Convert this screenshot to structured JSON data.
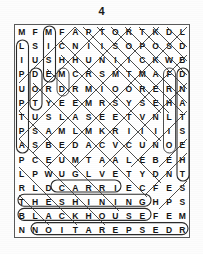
{
  "puzzle": {
    "number": "4",
    "type": "word-search",
    "rows": 15,
    "cols": 13,
    "grid": [
      [
        "M",
        "F",
        "M",
        "F",
        "A",
        "P",
        "T",
        "O",
        "R",
        "T",
        "K",
        "D",
        "L"
      ],
      [
        "L",
        "S",
        "I",
        "C",
        "N",
        "I",
        "I",
        "S",
        "O",
        "P",
        "O",
        "S",
        "D"
      ],
      [
        "I",
        "U",
        "S",
        "H",
        "H",
        "U",
        "N",
        "I",
        "I",
        "C",
        "K",
        "W",
        "B"
      ],
      [
        "P",
        "D",
        "E",
        "M",
        "C",
        "R",
        "S",
        "M",
        "T",
        "M",
        "A",
        "F",
        "D"
      ],
      [
        "U",
        "O",
        "R",
        "D",
        "R",
        "M",
        "I",
        "O",
        "O",
        "R",
        "E",
        "R",
        "N"
      ],
      [
        "P",
        "T",
        "Y",
        "E",
        "E",
        "M",
        "R",
        "S",
        "Y",
        "S",
        "E",
        "H",
        "A"
      ],
      [
        "T",
        "U",
        "S",
        "L",
        "A",
        "S",
        "E",
        "E",
        "T",
        "V",
        "N",
        "L",
        "T"
      ],
      [
        "P",
        "S",
        "A",
        "M",
        "L",
        "M",
        "K",
        "R",
        "I",
        "I",
        "I",
        "I",
        "S"
      ],
      [
        "A",
        "S",
        "B",
        "E",
        "D",
        "A",
        "C",
        "V",
        "C",
        "U",
        "N",
        "O",
        "E"
      ],
      [
        "P",
        "C",
        "E",
        "U",
        "M",
        "T",
        "A",
        "A",
        "L",
        "E",
        "B",
        "E",
        "H"
      ],
      [
        "L",
        "P",
        "W",
        "U",
        "G",
        "L",
        "V",
        "E",
        "T",
        "Y",
        "D",
        "N",
        "T"
      ],
      [
        "R",
        "L",
        "D",
        "C",
        "A",
        "R",
        "R",
        "I",
        "E",
        "C",
        "F",
        "E",
        "S"
      ],
      [
        "T",
        "H",
        "E",
        "S",
        "H",
        "I",
        "N",
        "I",
        "N",
        "G",
        "H",
        "P",
        "S"
      ],
      [
        "B",
        "L",
        "A",
        "C",
        "K",
        "H",
        "O",
        "U",
        "S",
        "E",
        "F",
        "E",
        "M"
      ],
      [
        "N",
        "N",
        "O",
        "I",
        "T",
        "A",
        "R",
        "E",
        "P",
        "S",
        "E",
        "D",
        "R"
      ]
    ],
    "found_words": [
      {
        "word": "CARRIE",
        "row": 12,
        "start_col": 4,
        "end_col": 9,
        "direction": "horizontal"
      },
      {
        "word": "THESHINING",
        "row": 13,
        "start_col": 1,
        "end_col": 10,
        "direction": "horizontal"
      },
      {
        "word": "BLACKHOUSE",
        "row": 14,
        "start_col": 1,
        "end_col": 10,
        "direction": "horizontal"
      },
      {
        "word": "DESPERATION",
        "row": 15,
        "start_col": 2,
        "end_col": 12,
        "direction": "horizontal-reversed"
      },
      {
        "word": "LIPUPTPA",
        "col": 1,
        "start_row": 2,
        "end_row": 9,
        "direction": "vertical"
      },
      {
        "word": "MISE",
        "col": 3,
        "start_row": 1,
        "end_row": 4,
        "direction": "vertical"
      },
      {
        "word": "DOR",
        "col": 2,
        "start_row": 4,
        "end_row": 6,
        "direction": "vertical"
      },
      {
        "word": "DNATISEHT",
        "col": 13,
        "start_row": 4,
        "end_row": 11,
        "direction": "vertical"
      }
    ]
  },
  "colors": {
    "ink": "#141414",
    "mark": "#2b2b2b",
    "frame": "#5a5a5a",
    "paper": "#ffffff"
  }
}
